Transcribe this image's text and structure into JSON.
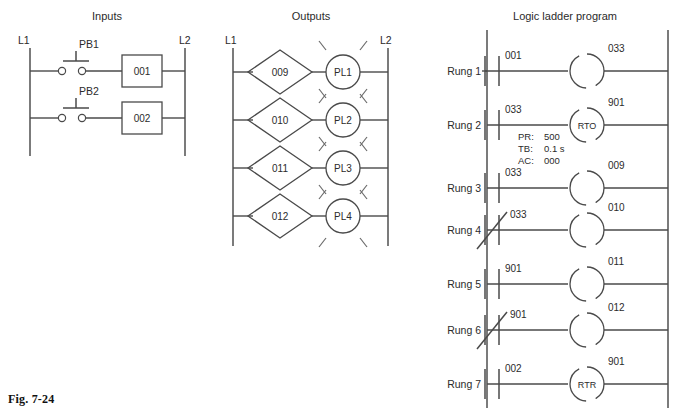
{
  "figure": {
    "caption": "Fig. 7-24"
  },
  "panels": {
    "inputs": {
      "title": "Inputs",
      "left_rail_label": "L1",
      "right_rail_label": "L2",
      "rows": [
        {
          "device": "PB1",
          "device_type": "normally-open-pushbutton",
          "module": "001"
        },
        {
          "device": "PB2",
          "device_type": "normally-open-pushbutton",
          "module": "002"
        }
      ]
    },
    "outputs": {
      "title": "Outputs",
      "left_rail_label": "L1",
      "right_rail_label": "L2",
      "rows": [
        {
          "module": "009",
          "lamp": "PL1"
        },
        {
          "module": "010",
          "lamp": "PL2"
        },
        {
          "module": "011",
          "lamp": "PL3"
        },
        {
          "module": "012",
          "lamp": "PL4"
        }
      ]
    },
    "ladder": {
      "title": "Logic ladder program",
      "rungs": [
        {
          "label": "Rung 1",
          "contact": {
            "address": "001",
            "type": "normally-open"
          },
          "output": {
            "address": "033",
            "type": "coil",
            "instruction": ""
          }
        },
        {
          "label": "Rung 2",
          "contact": {
            "address": "033",
            "type": "normally-open"
          },
          "output": {
            "address": "901",
            "type": "timer",
            "instruction": "RTO"
          },
          "timer": {
            "preset_label": "PR:",
            "preset_value": "500",
            "timebase_label": "TB:",
            "timebase_value": "0.1 s",
            "accumulated_label": "AC:",
            "accumulated_value": "000"
          }
        },
        {
          "label": "Rung 3",
          "contact": {
            "address": "033",
            "type": "normally-open"
          },
          "output": {
            "address": "009",
            "type": "coil",
            "instruction": ""
          }
        },
        {
          "label": "Rung 4",
          "contact": {
            "address": "033",
            "type": "normally-closed"
          },
          "output": {
            "address": "010",
            "type": "coil",
            "instruction": ""
          }
        },
        {
          "label": "Rung 5",
          "contact": {
            "address": "901",
            "type": "normally-open"
          },
          "output": {
            "address": "011",
            "type": "coil",
            "instruction": ""
          }
        },
        {
          "label": "Rung 6",
          "contact": {
            "address": "901",
            "type": "normally-closed"
          },
          "output": {
            "address": "012",
            "type": "coil",
            "instruction": ""
          }
        },
        {
          "label": "Rung 7",
          "contact": {
            "address": "002",
            "type": "normally-open"
          },
          "output": {
            "address": "901",
            "type": "timer-reset",
            "instruction": "RTR"
          }
        }
      ]
    }
  },
  "colors": {
    "line": "#4a4a4a",
    "rail": "#5a5a5a",
    "text": "#2b2b2b",
    "background": "#ffffff"
  }
}
